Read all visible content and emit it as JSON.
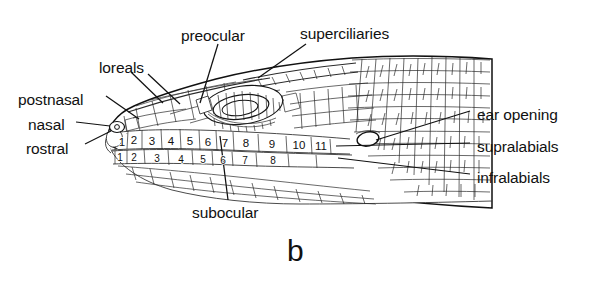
{
  "figure": {
    "panel_label": "b",
    "background_color": "#ffffff",
    "ink_color": "#111111"
  },
  "labels": [
    {
      "id": "preocular",
      "text": "preocular",
      "x": 181,
      "y": 28,
      "align": "left"
    },
    {
      "id": "superciliaries",
      "text": "superciliaries",
      "x": 300,
      "y": 26,
      "align": "left"
    },
    {
      "id": "loreals",
      "text": "loreals",
      "x": 99,
      "y": 60,
      "align": "left"
    },
    {
      "id": "postnasal",
      "text": "postnasal",
      "x": 18,
      "y": 92,
      "align": "left"
    },
    {
      "id": "nasal",
      "text": "nasal",
      "x": 28,
      "y": 117,
      "align": "left"
    },
    {
      "id": "rostral",
      "text": "rostral",
      "x": 26,
      "y": 141,
      "align": "left"
    },
    {
      "id": "ear-opening",
      "text": "ear opening",
      "x": 477,
      "y": 107,
      "align": "left"
    },
    {
      "id": "supralabials",
      "text": "supralabials",
      "x": 477,
      "y": 139,
      "align": "left"
    },
    {
      "id": "infralabials",
      "text": "infralabials",
      "x": 477,
      "y": 170,
      "align": "left"
    },
    {
      "id": "subocular",
      "text": "subocular",
      "x": 192,
      "y": 205,
      "align": "left"
    }
  ],
  "supralabials": {
    "name": "supralabials",
    "row": "upper",
    "count": 11,
    "numbers": [
      "1",
      "2",
      "3",
      "4",
      "5",
      "6",
      "7",
      "8",
      "9",
      "10",
      "11"
    ],
    "positions": [
      {
        "n": "1",
        "x": 122,
        "y": 142
      },
      {
        "n": "2",
        "x": 134,
        "y": 139
      },
      {
        "n": "3",
        "x": 152,
        "y": 140
      },
      {
        "n": "4",
        "x": 171,
        "y": 140
      },
      {
        "n": "5",
        "x": 190,
        "y": 140
      },
      {
        "n": "6",
        "x": 208,
        "y": 141
      },
      {
        "n": "7",
        "x": 224,
        "y": 142
      },
      {
        "n": "8",
        "x": 245,
        "y": 142
      },
      {
        "n": "9",
        "x": 272,
        "y": 143
      },
      {
        "n": "10",
        "x": 299,
        "y": 144
      },
      {
        "n": "11",
        "x": 320,
        "y": 145
      }
    ]
  },
  "infralabials": {
    "name": "infralabials",
    "row": "lower",
    "count": 8,
    "numbers": [
      "1",
      "2",
      "3",
      "4",
      "5",
      "6",
      "7",
      "8"
    ],
    "positions": [
      {
        "n": "1",
        "x": 120,
        "y": 157
      },
      {
        "n": "2",
        "x": 133,
        "y": 157
      },
      {
        "n": "3",
        "x": 156,
        "y": 158
      },
      {
        "n": "4",
        "x": 180,
        "y": 159
      },
      {
        "n": "5",
        "x": 202,
        "y": 159
      },
      {
        "n": "6",
        "x": 222,
        "y": 160
      },
      {
        "n": "7",
        "x": 244,
        "y": 160
      },
      {
        "n": "8",
        "x": 272,
        "y": 160
      }
    ]
  },
  "features": {
    "eye": "ocular scale ring with concentric ciliary scales",
    "ear": "ear opening tympanum aperture",
    "nasal": "nasal scale with nostril opening at snout"
  }
}
